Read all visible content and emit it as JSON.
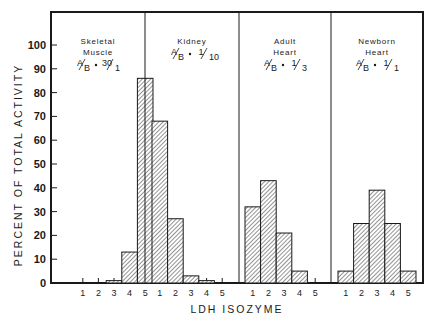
{
  "chart_data": {
    "type": "bar",
    "title": "",
    "xlabel": "LDH ISOZYME",
    "ylabel": "PERCENT OF TOTAL ACTIVITY",
    "ylim": [
      0,
      100
    ],
    "yticks": [
      0,
      10,
      20,
      30,
      40,
      50,
      60,
      70,
      80,
      90,
      100
    ],
    "categories": [
      "1",
      "2",
      "3",
      "4",
      "5"
    ],
    "grid": false,
    "legend": "none",
    "panels": [
      {
        "name": "Skeletal Muscle",
        "title_lines": [
          "Skeletal",
          "Muscle"
        ],
        "ratio": "A/B = 30/1",
        "ratio_num": "30",
        "ratio_den": "1",
        "values": [
          0,
          0,
          1,
          13,
          86
        ]
      },
      {
        "name": "Kidney",
        "title_lines": [
          "Kidney"
        ],
        "ratio": "A/B = 1/10",
        "ratio_num": "1",
        "ratio_den": "10",
        "values": [
          68,
          27,
          3,
          1,
          0
        ]
      },
      {
        "name": "Adult Heart",
        "title_lines": [
          "Adult",
          "Heart"
        ],
        "ratio": "A/B = 1/3",
        "ratio_num": "1",
        "ratio_den": "3",
        "values": [
          32,
          43,
          21,
          5,
          0
        ]
      },
      {
        "name": "Newborn Heart",
        "title_lines": [
          "Newborn",
          "Heart"
        ],
        "ratio": "A/B = 1/1",
        "ratio_num": "1",
        "ratio_den": "1",
        "values": [
          5,
          25,
          39,
          25,
          5
        ]
      }
    ]
  },
  "labels": {
    "ab": "A",
    "ab_den": "B",
    "equals": "="
  }
}
